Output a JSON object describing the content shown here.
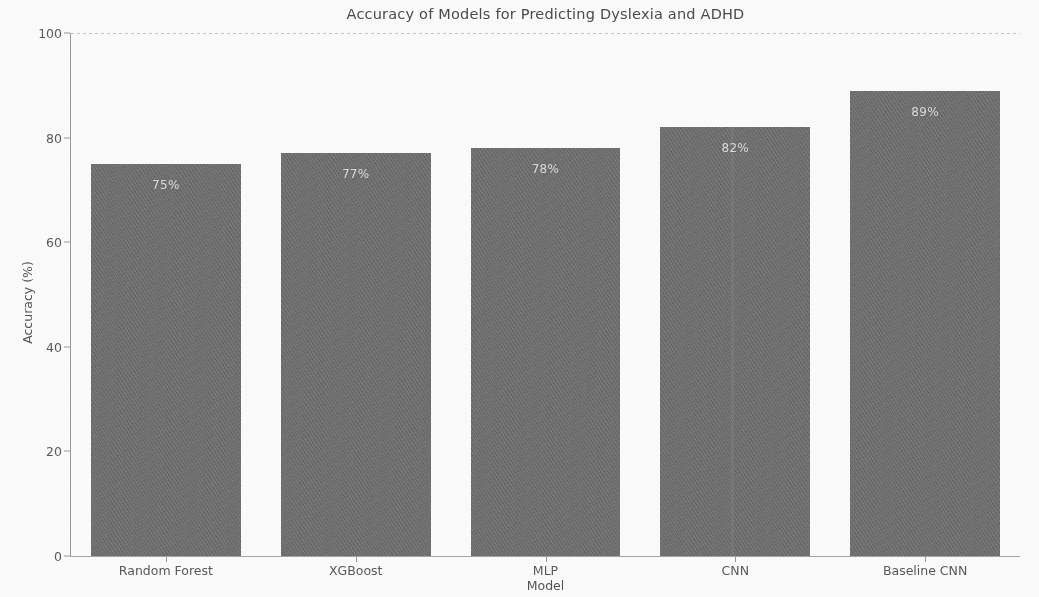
{
  "chart_data": {
    "type": "bar",
    "title": "Accuracy of Models for Predicting Dyslexia and ADHD",
    "xlabel": "Model",
    "ylabel": "Accuracy (%)",
    "categories": [
      "Random Forest",
      "XGBoost",
      "MLP",
      "CNN",
      "Baseline CNN"
    ],
    "values": [
      75,
      77,
      78,
      82,
      89
    ],
    "value_labels": [
      "75%",
      "77%",
      "78%",
      "82%",
      "89%"
    ],
    "ylim": [
      0,
      100
    ],
    "xlim": [
      0,
      5
    ],
    "yticks": [
      0,
      20,
      40,
      60,
      80,
      100
    ],
    "ytick_labels": [
      "0",
      "20",
      "40",
      "60",
      "80",
      "100"
    ],
    "grid": "top-edge-only",
    "legend": "none",
    "bar_color": "#6f6f6f",
    "value_label_color": "#ffffff",
    "background_color": "#ffffff",
    "axis_text_color": "#555555",
    "bar_width_fraction": 0.79
  }
}
